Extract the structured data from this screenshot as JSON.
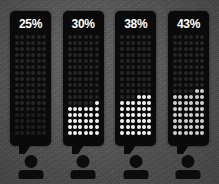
{
  "canvas": {
    "width": 219,
    "height": 184,
    "background_color": "#585858",
    "bubble_color": "#0a0a0a",
    "label_color": "#ffffff",
    "dot_on_color": "#f2f2f2",
    "dot_off_color": "#262626"
  },
  "chart_data": {
    "type": "bar",
    "subtype": "dot-matrix-pictogram",
    "title": "",
    "xlabel": "",
    "ylabel": "",
    "categories": [
      "Group 1",
      "Group 2",
      "Group 3",
      "Group 4"
    ],
    "values": [
      25,
      30,
      38,
      43
    ],
    "unit": "%",
    "ylim": [
      0,
      100
    ],
    "grid": false,
    "legend": null,
    "annotations": [
      "Each column is a speech bubble containing a 6-wide dot matrix; filled dots rise from the bottom in proportion to the percentage.",
      "A person silhouette icon sits beneath each speech bubble."
    ],
    "matrix": {
      "columns": 6,
      "rows": 17,
      "fill_direction": "bottom-up"
    }
  },
  "columns": [
    {
      "id": "column-1",
      "label": "25%",
      "value": 25,
      "filled_dots": 25,
      "fill_style": "dim",
      "icon": "person-icon"
    },
    {
      "id": "column-2",
      "label": "30%",
      "value": 30,
      "filled_dots": 31,
      "fill_style": "bright",
      "icon": "person-icon"
    },
    {
      "id": "column-3",
      "label": "38%",
      "value": 38,
      "filled_dots": 39,
      "fill_style": "bright",
      "icon": "person-icon"
    },
    {
      "id": "column-4",
      "label": "43%",
      "value": 43,
      "filled_dots": 44,
      "fill_style": "soft",
      "icon": "person-icon"
    }
  ]
}
